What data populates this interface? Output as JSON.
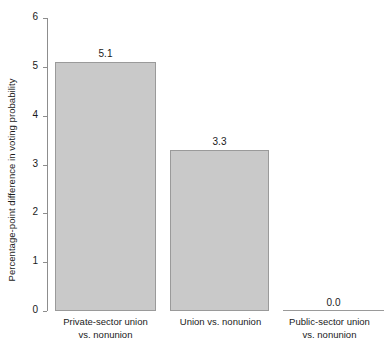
{
  "chart_data": {
    "type": "bar",
    "title": "",
    "xlabel": "",
    "ylabel": "Percentage-point difference in voting probability",
    "ylim": [
      0,
      6
    ],
    "yticks": [
      0,
      1,
      2,
      3,
      4,
      5,
      6
    ],
    "ytick_labels": [
      "0",
      "1",
      "2",
      "3",
      "4",
      "5",
      "6"
    ],
    "grid": false,
    "legend": null,
    "categories": [
      "Private-sector union vs. nonunion",
      "Union vs. nonunion",
      "Public-sector union vs. nonunion"
    ],
    "category_lines": [
      [
        "Private-sector union",
        "vs. nonunion"
      ],
      [
        "Union vs. nonunion"
      ],
      [
        "Public-sector union",
        "vs. nonunion"
      ]
    ],
    "values": [
      5.1,
      3.3,
      0.0
    ],
    "value_labels": [
      "5.1",
      "3.3",
      "0.0"
    ],
    "colors": {
      "bar_fill": "#c9c9c9",
      "bar_edge": "#9a9a9a",
      "axis": "#8d8d8d",
      "text": "#1a1a1a",
      "background": "#ffffff"
    }
  }
}
